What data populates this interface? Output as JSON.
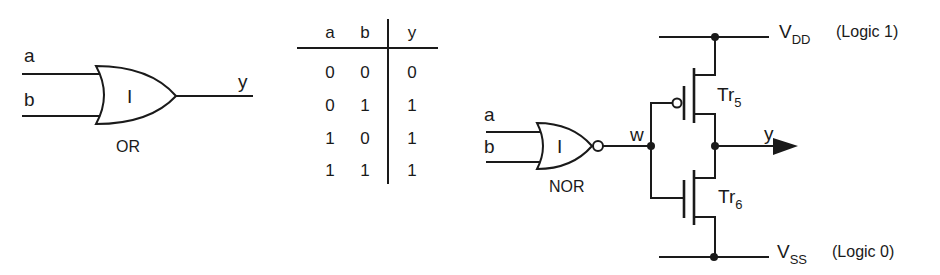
{
  "or_gate": {
    "input_a": "a",
    "input_b": "b",
    "output": "y",
    "symbol": "I",
    "caption": "OR"
  },
  "truth_table": {
    "headers": [
      "a",
      "b",
      "y"
    ],
    "rows": [
      [
        "0",
        "0",
        "0"
      ],
      [
        "0",
        "1",
        "1"
      ],
      [
        "1",
        "0",
        "1"
      ],
      [
        "1",
        "1",
        "1"
      ]
    ]
  },
  "cmos_circuit": {
    "nor_gate": {
      "input_a": "a",
      "input_b": "b",
      "symbol": "I",
      "caption": "NOR"
    },
    "node_w": "w",
    "output": "y",
    "pmos": {
      "name": "Tr",
      "subscript": "5"
    },
    "nmos": {
      "name": "Tr",
      "subscript": "6"
    },
    "vdd": {
      "name": "V",
      "subscript": "DD",
      "note": "(Logic 1)"
    },
    "vss": {
      "name": "V",
      "subscript": "SS",
      "note": "(Logic 0)"
    }
  },
  "colors": {
    "ink": "#1a1a1a",
    "background": "#ffffff"
  }
}
